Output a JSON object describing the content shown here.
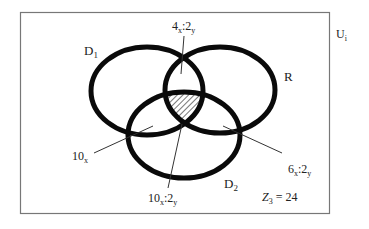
{
  "diagram": {
    "type": "venn",
    "universe_label": "U",
    "universe_sub": "i",
    "sets": [
      {
        "id": "D1",
        "label": "D",
        "sub": "1"
      },
      {
        "id": "R",
        "label": "R",
        "sub": ""
      },
      {
        "id": "D2",
        "label": "D",
        "sub": "2"
      }
    ],
    "regions": [
      {
        "id": "d1-r",
        "a": "4",
        "a_sub": "x",
        "sep": ":",
        "b": "2",
        "b_sub": "y"
      },
      {
        "id": "d1-d2",
        "a": "10",
        "a_sub": "x",
        "sep": "",
        "b": "",
        "b_sub": ""
      },
      {
        "id": "r-d2",
        "a": "6",
        "a_sub": "x",
        "sep": ":",
        "b": "2",
        "b_sub": "y"
      },
      {
        "id": "d1-r-d2",
        "a": "10",
        "a_sub": "x",
        "sep": ":",
        "b": "2",
        "b_sub": "y"
      }
    ],
    "shaded_region": "D1 ∩ R ∩ D2",
    "outside": {
      "label": "Z",
      "sub": "3",
      "eq": " = 24"
    }
  }
}
